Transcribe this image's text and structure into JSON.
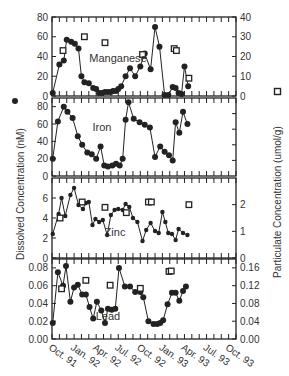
{
  "chart_data": {
    "type": "line",
    "title": "",
    "ylabel_left": "Dissolved Concentration (nM)",
    "ylabel_right": "Particulate Concentration (umol/g)",
    "legend": [
      {
        "symbol": "filled-circle",
        "label": "Dissolved Concentration (nM)"
      },
      {
        "symbol": "open-square",
        "label": "Particulate Concentration (umol/g)"
      }
    ],
    "x_tick_labels": [
      "Oct. 91",
      "Jan. 92",
      "Apr. 92",
      "Jul. 92",
      "Oct. 92",
      "Jan. 93",
      "Apr. 93",
      "Jul. 93",
      "Oct. 93"
    ],
    "x_range_months": [
      0,
      25
    ],
    "panels": [
      {
        "name": "Manganese",
        "left_ylim": [
          0,
          80
        ],
        "left_ticks": [
          "0",
          "20",
          "40",
          "60",
          "80"
        ],
        "right_ylim": [
          0,
          40
        ],
        "right_ticks": [
          "0",
          "10",
          "20",
          "30",
          "40"
        ],
        "dissolved": {
          "x": [
            0.1,
            1.0,
            1.6,
            2.0,
            2.6,
            3.1,
            3.6,
            4.0,
            4.4,
            5.0,
            5.6,
            6.0,
            6.4,
            6.8,
            7.2,
            7.6,
            8.0,
            8.3,
            8.7,
            9.0,
            9.4,
            10.0,
            10.6,
            11.3,
            12.0,
            12.6,
            13.4,
            14.0,
            14.6,
            15.3,
            15.8,
            16.4,
            16.8,
            17.2,
            17.6,
            18.0,
            18.5
          ],
          "values": [
            3,
            32,
            36,
            57,
            55,
            53,
            48,
            20,
            14,
            13,
            8,
            7,
            3,
            3,
            4,
            4,
            4,
            5,
            5,
            7,
            10,
            20,
            28,
            20,
            30,
            43,
            27,
            70,
            50,
            1,
            1,
            9,
            8,
            3,
            2,
            30,
            10
          ]
        },
        "particulate": {
          "x": [
            1.5,
            4.4,
            7.2,
            12.3,
            16.6,
            16.9,
            18.6
          ],
          "values": [
            23,
            30,
            27,
            21,
            24,
            23,
            9
          ]
        }
      },
      {
        "name": "Iron",
        "left_ylim": [
          0,
          90
        ],
        "left_ticks": [
          "0",
          "20",
          "40",
          "60",
          "80"
        ],
        "right_ylim": [
          0,
          40
        ],
        "right_ticks": [],
        "dissolved": {
          "x": [
            0.1,
            0.8,
            1.6,
            2.1,
            2.8,
            3.5,
            4.1,
            4.8,
            5.4,
            6.0,
            6.6,
            7.1,
            7.6,
            8.2,
            8.7,
            9.2,
            9.6,
            10.0,
            10.4,
            11.1,
            11.9,
            12.6,
            13.3,
            14.0,
            14.7,
            15.3,
            15.9,
            16.4,
            16.8,
            17.3,
            17.8,
            18.4
          ],
          "values": [
            20,
            63,
            80,
            74,
            67,
            46,
            36,
            27,
            25,
            20,
            34,
            12,
            11,
            12,
            14,
            12,
            20,
            65,
            85,
            66,
            62,
            59,
            56,
            22,
            34,
            28,
            24,
            18,
            62,
            50,
            74,
            60
          ]
        },
        "particulate": {
          "x": [],
          "values": []
        }
      },
      {
        "name": "Zinc",
        "left_ylim": [
          0,
          8
        ],
        "left_ticks": [
          "0",
          "2",
          "4",
          "6"
        ],
        "right_ylim": [
          0,
          3
        ],
        "right_ticks": [
          "0",
          "1",
          "2"
        ],
        "dissolved": {
          "x": [
            0.1,
            0.9,
            1.3,
            1.8,
            2.5,
            3.0,
            3.6,
            4.2,
            4.6,
            5.0,
            5.5,
            5.9,
            6.4,
            6.9,
            7.5,
            8.0,
            8.5,
            9.0,
            9.6,
            10.0,
            10.5,
            11.0,
            11.6,
            12.3,
            12.8,
            13.4,
            14.0,
            14.5,
            15.0,
            15.4,
            15.8,
            16.3,
            16.8,
            17.2,
            17.8,
            18.4
          ],
          "values": [
            2.4,
            4.4,
            6.0,
            4.2,
            6.3,
            7.0,
            5.3,
            4.9,
            5.5,
            5.6,
            3.3,
            3.9,
            3.6,
            3.8,
            2.3,
            4.3,
            4.8,
            4.9,
            4.8,
            5.4,
            5.1,
            4.0,
            3.6,
            1.7,
            2.8,
            3.5,
            2.7,
            2.5,
            4.6,
            3.6,
            2.5,
            2.4,
            1.8,
            2.9,
            2.5,
            2.3
          ]
        },
        "particulate": {
          "x": [
            1.1,
            4.1,
            7.2,
            10.1,
            13.1,
            13.5,
            18.6
          ],
          "values": [
            1.5,
            2.1,
            1.9,
            1.7,
            2.1,
            2.1,
            2.0
          ]
        }
      },
      {
        "name": "Lead",
        "left_ylim": [
          0.0,
          0.09
        ],
        "left_ticks": [
          "0.00",
          "0.02",
          "0.04",
          "0.06",
          "0.08"
        ],
        "right_ylim": [
          0.0,
          0.18
        ],
        "right_ticks": [
          "0.00",
          "0.04",
          "0.08",
          "0.12",
          "0.16"
        ],
        "dissolved": {
          "x": [
            0.1,
            0.8,
            1.5,
            1.9,
            2.5,
            3.0,
            3.5,
            4.1,
            4.6,
            5.1,
            5.6,
            6.1,
            6.7,
            7.2,
            7.6,
            8.1,
            8.6,
            9.1,
            9.9,
            10.6,
            11.3,
            12.0,
            12.4,
            13.1,
            13.8,
            14.3,
            14.7,
            15.1,
            15.7,
            16.3,
            16.8,
            17.3,
            17.8,
            18.2
          ],
          "values": [
            0.018,
            0.075,
            0.06,
            0.082,
            0.042,
            0.058,
            0.061,
            0.05,
            0.05,
            0.036,
            0.023,
            0.042,
            0.032,
            0.018,
            0.034,
            0.033,
            0.034,
            0.08,
            0.059,
            0.059,
            0.053,
            0.053,
            0.047,
            0.02,
            0.017,
            0.017,
            0.018,
            0.021,
            0.039,
            0.052,
            0.052,
            0.043,
            0.054,
            0.059
          ]
        },
        "particulate": {
          "x": [
            1.3,
            4.6,
            7.9,
            12.0,
            15.9,
            16.2
          ],
          "values": [
            0.113,
            0.132,
            0.121,
            0.114,
            0.152,
            0.153
          ]
        }
      }
    ]
  },
  "labels": {
    "panel_manganese": "Manganese",
    "panel_iron": "Iron",
    "panel_zinc": "Zinc",
    "panel_lead": "Lead",
    "ylabel_left": "Dissolved Concentration (nM)",
    "ylabel_right": "Particulate Concentration (umol/g)"
  }
}
